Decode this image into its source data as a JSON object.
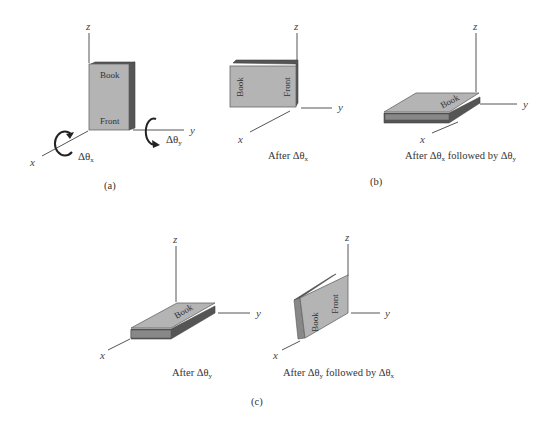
{
  "figure": {
    "panel_a": {
      "label": "(a)",
      "axes": {
        "x": "x",
        "y": "y",
        "z": "z"
      },
      "book": {
        "title": "Book",
        "subtitle": "Front"
      },
      "rotations": {
        "about_x": "Δθ",
        "about_x_sub": "x",
        "about_y": "Δθ",
        "about_y_sub": "y"
      }
    },
    "panel_b": {
      "label": "(b)",
      "left": {
        "axes": {
          "x": "x",
          "y": "y",
          "z": "z"
        },
        "book": {
          "title": "Book",
          "subtitle": "Front"
        },
        "caption_prefix": "After Δθ",
        "caption_sub": "x"
      },
      "right": {
        "axes": {
          "x": "x",
          "y": "y",
          "z": "z"
        },
        "book": {
          "title": "Book"
        },
        "caption_prefix": "After Δθ",
        "caption_sub1": "x",
        "caption_mid": " followed by Δθ",
        "caption_sub2": "y"
      }
    },
    "panel_c": {
      "label": "(c)",
      "left": {
        "axes": {
          "x": "x",
          "y": "y",
          "z": "z"
        },
        "book": {
          "title": "Book"
        },
        "caption_prefix": "After Δθ",
        "caption_sub": "y"
      },
      "right": {
        "axes": {
          "x": "x",
          "y": "y",
          "z": "z"
        },
        "book": {
          "title": "Book",
          "subtitle": "Front"
        },
        "caption_prefix": "After Δθ",
        "caption_sub1": "y",
        "caption_mid": " followed by Δθ",
        "caption_sub2": "x"
      }
    }
  }
}
